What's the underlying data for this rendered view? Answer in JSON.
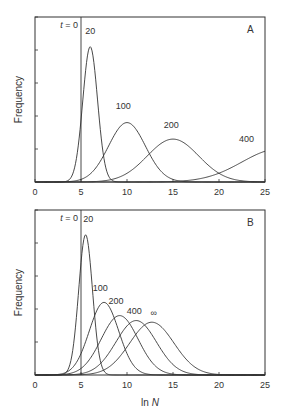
{
  "chart_data": [
    {
      "panel": "A",
      "type": "line",
      "xlabel": "ln N",
      "ylabel": "Frequency",
      "xlim": [
        0,
        25
      ],
      "xticks": [
        0,
        5,
        10,
        15,
        20,
        25
      ],
      "yticks_unlabeled": 5,
      "vertical_marker": {
        "x": 5,
        "label": "t = 0"
      },
      "series": [
        {
          "name": "20",
          "peak_x": 6.0,
          "peak_rel_height": 0.82,
          "sigma": 0.8,
          "label_pos": [
            6.0,
            0.9
          ]
        },
        {
          "name": "100",
          "peak_x": 10.0,
          "peak_rel_height": 0.36,
          "sigma": 2.0,
          "label_pos": [
            9.6,
            0.44
          ]
        },
        {
          "name": "200",
          "peak_x": 15.0,
          "peak_rel_height": 0.26,
          "sigma": 2.8,
          "label_pos": [
            14.8,
            0.33
          ]
        },
        {
          "name": "400",
          "peak_x": 26.5,
          "peak_rel_height": 0.2,
          "sigma": 4.0,
          "label_pos": [
            23.0,
            0.24
          ]
        }
      ]
    },
    {
      "panel": "B",
      "type": "line",
      "xlabel": "ln N",
      "ylabel": "Frequency",
      "xlim": [
        0,
        25
      ],
      "xticks": [
        0,
        5,
        10,
        15,
        20,
        25
      ],
      "yticks_unlabeled": 5,
      "vertical_marker": {
        "x": 5,
        "label": "t = 0"
      },
      "series": [
        {
          "name": "20",
          "peak_x": 5.5,
          "peak_rel_height": 0.85,
          "sigma": 0.75,
          "label_pos": [
            5.8,
            0.93
          ]
        },
        {
          "name": "100",
          "peak_x": 7.5,
          "peak_rel_height": 0.44,
          "sigma": 1.6,
          "label_pos": [
            7.1,
            0.51
          ]
        },
        {
          "name": "200",
          "peak_x": 9.2,
          "peak_rel_height": 0.36,
          "sigma": 2.0,
          "label_pos": [
            8.8,
            0.43
          ]
        },
        {
          "name": "400",
          "peak_x": 11.0,
          "peak_rel_height": 0.33,
          "sigma": 2.2,
          "label_pos": [
            10.8,
            0.37
          ]
        },
        {
          "name": "∞",
          "peak_x": 12.7,
          "peak_rel_height": 0.32,
          "sigma": 2.4,
          "label_pos": [
            12.9,
            0.36
          ]
        }
      ]
    }
  ],
  "labels": {
    "panel_a": "A",
    "panel_b": "B",
    "t0": "t = 0",
    "ylabel": "Frequency",
    "xlabel_prefix": "ln ",
    "xlabel_var": "N"
  },
  "colors": {
    "line": "#333333",
    "background": "#ffffff"
  }
}
